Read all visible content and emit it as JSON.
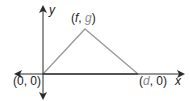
{
  "diagram": {
    "type": "coordinate-triangle",
    "axes": {
      "x_label": "x",
      "y_label": "y",
      "color": "#2b2b2b"
    },
    "triangle": {
      "stroke_color": "#9a9a9a",
      "vertices": [
        {
          "name": "origin",
          "label": "(0, 0)",
          "coords": [
            "0",
            "0"
          ]
        },
        {
          "name": "apex",
          "label": "(f, g)",
          "coords": [
            "f",
            "g"
          ]
        },
        {
          "name": "right",
          "label": "(d, 0)",
          "coords": [
            "d",
            "0"
          ]
        }
      ]
    },
    "labels": {
      "origin": {
        "open": "(",
        "a": "0",
        "sep": ", ",
        "b": "0",
        "close": ")"
      },
      "apex": {
        "open": "(",
        "a": "f",
        "sep": ", ",
        "b": "g",
        "close": ")"
      },
      "right": {
        "open": "(",
        "a": "d",
        "sep": ", ",
        "b": "0",
        "close": ")"
      }
    }
  }
}
